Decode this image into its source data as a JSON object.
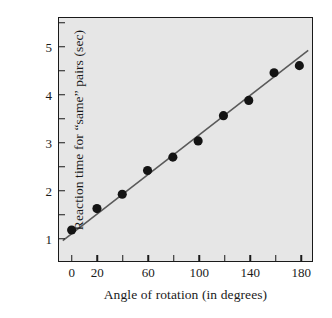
{
  "chart_data": {
    "type": "scatter",
    "title": "",
    "subtitle": "",
    "xlabel": "Angle of rotation (in degrees)",
    "ylabel": "Reaction time for “same” pairs (sec)",
    "xlim": [
      -10,
      190
    ],
    "ylim": [
      0.5,
      5.6
    ],
    "x_ticks_major": [
      0,
      20,
      40,
      60,
      80,
      100,
      120,
      140,
      160,
      180
    ],
    "x_tick_labels": [
      "0",
      "20",
      "",
      "60",
      "",
      "100",
      "",
      "140",
      "",
      "180"
    ],
    "y_ticks_major": [
      1,
      2,
      3,
      4,
      5
    ],
    "y_tick_labels": [
      "1",
      "2",
      "3",
      "4",
      "5"
    ],
    "y_ticks_minor": [
      1.5,
      2.5,
      3.5,
      4.5,
      5.5
    ],
    "grid": false,
    "legend": null,
    "x": [
      0,
      20,
      40,
      60,
      80,
      100,
      120,
      140,
      160,
      180
    ],
    "values": [
      1.15,
      1.6,
      1.9,
      2.4,
      2.68,
      3.02,
      3.55,
      3.87,
      4.45,
      4.6
    ],
    "series": [
      {
        "name": "Reaction time",
        "marker": "filled-circle",
        "marker_color": "#141414",
        "values": [
          1.15,
          1.6,
          1.9,
          2.4,
          2.68,
          3.02,
          3.55,
          3.87,
          4.45,
          4.6
        ]
      }
    ],
    "trendline": {
      "name": "best-fit line",
      "color": "#5a5a5a",
      "x_start": -7,
      "y_start": 0.93,
      "x_end": 187,
      "y_end": 4.92
    },
    "colors": {
      "plot_background": "#e6e6e6",
      "figure_background": "#ffffff",
      "axis": "#1a1a1a",
      "marker": "#141414",
      "line": "#5a5a5a"
    }
  },
  "figure": {
    "x_axis_title": "Angle of rotation (in degrees)",
    "y_axis_title": "Reaction time for “same” pairs (sec)"
  }
}
